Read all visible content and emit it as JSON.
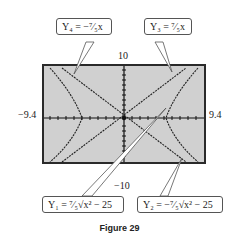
{
  "figure": {
    "caption": "Figure 29",
    "window": {
      "xmin": "−9.4",
      "xmax": "9.4",
      "ymin": "−10",
      "ymax": "10"
    },
    "callouts": {
      "y4": "Y₄ = −⁷⁄₅x",
      "y3": "Y₃ = ⁷⁄₅x",
      "y1": "Y₁ = ⁷⁄₅√x² − 25",
      "y2": "Y₂ = −⁷⁄₅√x² − 25"
    },
    "colors": {
      "screen": "#d0d0d0",
      "curve": "#222222"
    }
  }
}
